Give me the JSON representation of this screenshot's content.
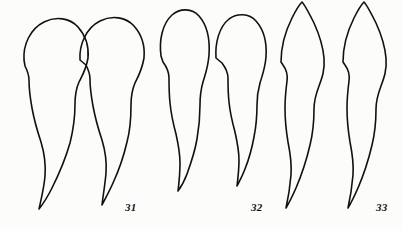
{
  "figure": {
    "type": "scientific-line-drawing-plate",
    "background_color": "#fcfcfb",
    "ink_color": "#111111",
    "width": 403,
    "height": 231,
    "specimen_count": 6,
    "pair_count": 3
  },
  "labels": [
    {
      "id": "31",
      "text": "31",
      "x": 125,
      "y": 201
    },
    {
      "id": "32",
      "text": "32",
      "x": 251,
      "y": 201
    },
    {
      "id": "33",
      "text": "33",
      "x": 376,
      "y": 201
    }
  ],
  "specimens": [
    {
      "name": "specimen-1",
      "pair": "31",
      "position": "left",
      "apex_shape": "broad-rounded-dome",
      "path": "M 24 60 C 23 45 30 29 44 22 C 56 16 70 18 78 27 C 86 36 89 47 88 58 C 86 70 82 76 79 82 C 76 89 75 96 75 104 C 75 118 73 131 70 143 C 66 157 59 174 52 188 C 47 198 43 204 39 209 C 41 200 44 188 45 176 C 46 163 44 152 41 142 C 37 130 34 119 32 108 C 30 97 29 88 29 80 C 29 74 27 70 25 66 Z"
    },
    {
      "name": "specimen-2",
      "pair": "31",
      "position": "right",
      "apex_shape": "broad-rounded-dome",
      "path": "M 80 60 C 79 45 86 28 100 21 C 112 15 126 17 134 26 C 142 35 145 47 144 58 C 142 70 138 77 135 83 C 132 90 131 97 131 105 C 131 118 130 131 127 142 C 124 155 119 170 113 183 C 109 192 105 199 102 205 C 103 196 105 185 106 173 C 107 160 105 150 102 140 C 98 128 95 117 93 106 C 91 95 90 87 90 79 C 90 73 88 69 86 65 Z"
    },
    {
      "name": "specimen-3",
      "pair": "32",
      "position": "left",
      "apex_shape": "narrow-bullet",
      "path": "M 161 56 C 159 41 162 24 172 15 C 180 8 192 8 199 16 C 207 25 210 40 209 55 C 208 68 205 75 203 82 C 201 89 200 97 200 105 C 200 117 199 128 197 139 C 195 151 191 163 187 174 C 184 182 181 187 178 191 C 179 183 180 173 180 163 C 180 152 178 143 176 134 C 173 123 171 113 170 103 C 169 93 169 85 169 78 C 169 72 166 66 163 62 Z"
    },
    {
      "name": "specimen-4",
      "pair": "32",
      "position": "right",
      "apex_shape": "narrow-bullet",
      "path": "M 216 58 C 215 43 219 27 229 19 C 237 13 249 13 256 21 C 264 30 267 43 266 57 C 265 69 262 76 260 83 C 258 90 257 97 257 105 C 257 116 256 127 254 137 C 252 148 249 159 245 169 C 242 177 239 182 237 186 C 238 178 239 169 239 160 C 239 150 237 141 235 132 C 232 121 230 112 229 102 C 228 93 228 85 228 78 C 228 72 225 67 222 63 Z"
    },
    {
      "name": "specimen-5",
      "pair": "33",
      "position": "left",
      "apex_shape": "pointed-peak",
      "path": "M 281 62 C 281 48 285 32 292 18 C 296 10 300 4 302 2 C 305 5 309 13 314 23 C 319 34 323 46 324 58 C 325 70 322 78 319 86 C 316 94 314 101 314 109 C 314 121 313 133 310 145 C 307 158 302 174 296 188 C 292 197 289 203 286 208 C 288 199 290 187 291 175 C 292 162 290 152 288 142 C 286 130 285 119 285 108 C 285 98 286 89 287 81 C 288 74 286 69 283 65 Z"
    },
    {
      "name": "specimen-6",
      "pair": "33",
      "position": "right",
      "apex_shape": "pointed-peak",
      "path": "M 343 62 C 343 48 347 32 354 18 C 358 10 362 4 364 2 C 367 5 371 13 376 23 C 381 34 385 46 386 58 C 387 70 384 78 381 86 C 378 94 376 101 376 109 C 376 121 375 133 372 145 C 369 158 364 174 358 188 C 354 197 351 203 348 208 C 350 199 352 187 353 175 C 354 162 352 152 350 142 C 348 130 347 119 347 108 C 347 98 348 89 349 81 C 350 74 348 69 345 65 Z"
    }
  ]
}
